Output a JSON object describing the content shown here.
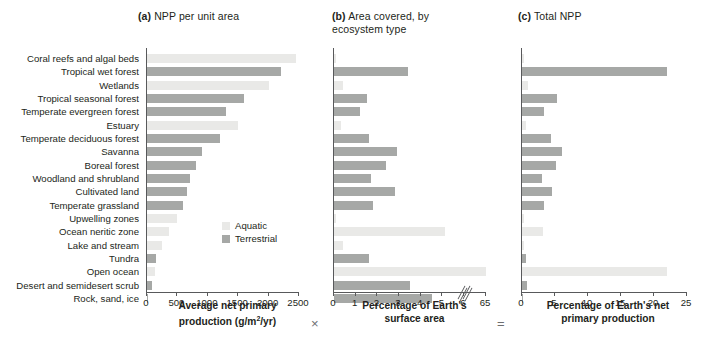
{
  "figure": {
    "panels": [
      {
        "tag": "(a)",
        "title": "NPP per unit area"
      },
      {
        "tag": "(b)",
        "title": "Area covered, by\necosystem type"
      },
      {
        "tag": "(c)",
        "title": "Total NPP"
      }
    ],
    "operators": {
      "multiply": "×",
      "equals": "="
    }
  },
  "legend": {
    "position": "inside-panel-a-lower-right",
    "entries": [
      {
        "label": "Aquatic",
        "color": "#e9e9e7"
      },
      {
        "label": "Terrestrial",
        "color": "#a6a8a6"
      }
    ]
  },
  "categories": [
    "Coral reefs and algal beds",
    "Tropical wet forest",
    "Wetlands",
    "Tropical seasonal forest",
    "Temperate evergreen forest",
    "Estuary",
    "Temperate deciduous forest",
    "Savanna",
    "Boreal forest",
    "Woodland and shrubland",
    "Cultivated land",
    "Temperate grassland",
    "Upwelling zones",
    "Ocean neritic zone",
    "Lake and stream",
    "Tundra",
    "Open ocean",
    "Desert and semidesert scrub",
    "Rock, sand, ice"
  ],
  "group_of_category": [
    "Aquatic",
    "Terrestrial",
    "Aquatic",
    "Terrestrial",
    "Terrestrial",
    "Aquatic",
    "Terrestrial",
    "Terrestrial",
    "Terrestrial",
    "Terrestrial",
    "Terrestrial",
    "Terrestrial",
    "Aquatic",
    "Aquatic",
    "Aquatic",
    "Terrestrial",
    "Aquatic",
    "Terrestrial",
    "Terrestrial"
  ],
  "chart_data": [
    {
      "type": "bar",
      "panel": "a",
      "title": "NPP per unit area",
      "xlabel": "Average net primary production (g/m2/yr)",
      "xlabel_lines": [
        "Average net primary",
        "production (g/m",
        "/yr)"
      ],
      "xlabel_superscript": "2",
      "ylabel": "",
      "orientation": "horizontal",
      "xlim": [
        0,
        2500
      ],
      "xticks": [
        0,
        500,
        1000,
        1500,
        2000,
        2500
      ],
      "grid": false,
      "categories": [
        "Coral reefs and algal beds",
        "Tropical wet forest",
        "Wetlands",
        "Tropical seasonal forest",
        "Temperate evergreen forest",
        "Estuary",
        "Temperate deciduous forest",
        "Savanna",
        "Boreal forest",
        "Woodland and shrubland",
        "Cultivated land",
        "Temperate grassland",
        "Upwelling zones",
        "Ocean neritic zone",
        "Lake and stream",
        "Tundra",
        "Open ocean",
        "Desert and semidesert scrub",
        "Rock, sand, ice"
      ],
      "values": [
        2450,
        2200,
        2000,
        1600,
        1300,
        1500,
        1200,
        900,
        800,
        700,
        650,
        600,
        500,
        360,
        250,
        140,
        125,
        90,
        3
      ]
    },
    {
      "type": "bar",
      "panel": "b",
      "title": "Area covered, by ecosystem type",
      "xlabel": "Percentage of Earth's surface area",
      "xlabel_lines": [
        "Percentage of Earth's",
        "surface area"
      ],
      "orientation": "horizontal",
      "xlim": [
        0,
        6
      ],
      "xticks": [
        0,
        1,
        2,
        3,
        4,
        5,
        6,
        65
      ],
      "axis_break": {
        "after": 6,
        "resume_label": 65
      },
      "grid": false,
      "categories": [
        "Coral reefs and algal beds",
        "Tropical wet forest",
        "Wetlands",
        "Tropical seasonal forest",
        "Temperate evergreen forest",
        "Estuary",
        "Temperate deciduous forest",
        "Savanna",
        "Boreal forest",
        "Woodland and shrubland",
        "Cultivated land",
        "Temperate grassland",
        "Upwelling zones",
        "Ocean neritic zone",
        "Lake and stream",
        "Tundra",
        "Open ocean",
        "Desert and semidesert scrub",
        "Rock, sand, ice"
      ],
      "values": [
        0.1,
        3.4,
        0.4,
        1.5,
        1.2,
        0.3,
        1.6,
        2.9,
        2.4,
        1.7,
        2.8,
        1.8,
        0.1,
        5.1,
        0.4,
        1.6,
        65,
        3.5,
        4.5
      ]
    },
    {
      "type": "bar",
      "panel": "c",
      "title": "Total NPP",
      "xlabel": "Percentage of Earth's net primary production",
      "xlabel_lines": [
        "Percentage of Earth's net",
        "primary production"
      ],
      "orientation": "horizontal",
      "xlim": [
        0,
        25
      ],
      "xticks": [
        0,
        5,
        10,
        15,
        20,
        25
      ],
      "grid": false,
      "categories": [
        "Coral reefs and algal beds",
        "Tropical wet forest",
        "Wetlands",
        "Tropical seasonal forest",
        "Temperate evergreen forest",
        "Estuary",
        "Temperate deciduous forest",
        "Savanna",
        "Boreal forest",
        "Woodland and shrubland",
        "Cultivated land",
        "Temperate grassland",
        "Upwelling zones",
        "Ocean neritic zone",
        "Lake and stream",
        "Tundra",
        "Open ocean",
        "Desert and semidesert scrub",
        "Rock, sand, ice"
      ],
      "values": [
        0.3,
        22.0,
        0.9,
        5.3,
        3.4,
        0.6,
        4.4,
        6.0,
        5.1,
        3.1,
        4.6,
        3.3,
        0.3,
        3.2,
        0.3,
        0.6,
        22.0,
        0.7,
        0.1
      ]
    }
  ]
}
